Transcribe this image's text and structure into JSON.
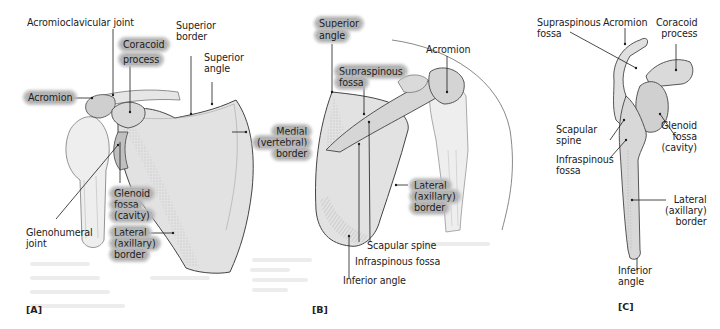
{
  "figure": {
    "subject": "Scapula",
    "panels": [
      {
        "id": "A",
        "label": "[A]",
        "view": "Anterior",
        "labels": {
          "acromioclavicular_joint": "Acromioclavicular joint",
          "coracoid_process": "Coracoid\nprocess",
          "superior_border": "Superior\nborder",
          "superior_angle": "Superior\nangle",
          "acromion": "Acromion",
          "medial_border": "Medial\n(vertebral)\nborder",
          "glenoid_fossa": "Glenoid\nfossa\n(cavity)",
          "glenohumeral_joint": "Glenohumeral\njoint",
          "lateral_border": "Lateral\n(axillary)\nborder"
        }
      },
      {
        "id": "B",
        "label": "[B]",
        "view": "Posterior",
        "labels": {
          "superior_angle": "Superior\nangle",
          "acromion": "Acromion",
          "supraspinous_fossa": "Supraspinous\nfossa",
          "lateral_border": "Lateral\n(axillary)\nborder",
          "scapular_spine": "Scapular spine",
          "infraspinous_fossa": "Infraspinous fossa",
          "inferior_angle": "Inferior angle"
        }
      },
      {
        "id": "C",
        "label": "[C]",
        "view": "Lateral",
        "labels": {
          "supraspinous_fossa": "Supraspinous\nfossa",
          "acromion": "Acromion",
          "coracoid_process": "Coracoid\nprocess",
          "scapular_spine": "Scapular\nspine",
          "glenoid_fossa": "Glenoid\nfossa\n(cavity)",
          "infraspinous_fossa": "Infraspinous\nfossa",
          "lateral_border": "Lateral\n(axillary)\nborder",
          "inferior_angle": "Inferior\nangle"
        }
      }
    ]
  },
  "colors": {
    "background": "#ffffff",
    "highlight": "#b4b4b4",
    "bone_fill": "#e4e4e4",
    "bone_shade": "#c8c8c8",
    "line": "#1c1c1c"
  }
}
